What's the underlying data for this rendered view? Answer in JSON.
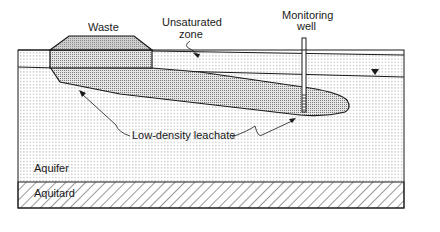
{
  "diagram": {
    "labels": {
      "waste": "Waste",
      "unsaturated_zone_line1": "Unsaturated",
      "unsaturated_zone_line2": "zone",
      "monitoring_well_line1": "Monitoring",
      "monitoring_well_line2": "well",
      "leachate": "Low-density leachate",
      "aquifer": "Aquifer",
      "aquitard": "Aquitard"
    },
    "symbols": {
      "water_table": "water-table-triangle"
    },
    "colors": {
      "line": "#1a1a1a",
      "background": "#ffffff",
      "dot_pattern": "#9a9a9a",
      "plume_fill": "#bdbdbd",
      "waste_fill": "#b0b0b0"
    }
  }
}
